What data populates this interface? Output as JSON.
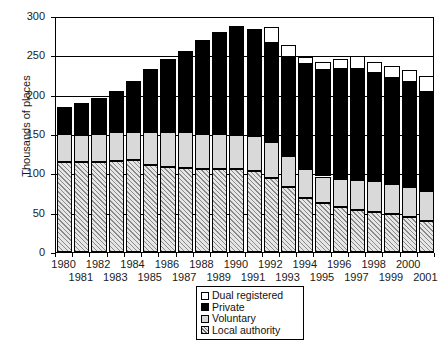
{
  "chart_data": {
    "type": "bar",
    "stacked": true,
    "title": "",
    "xlabel": "",
    "ylabel": "Thousands of places",
    "ylim": [
      0,
      300
    ],
    "yticks": [
      0,
      50,
      100,
      150,
      200,
      250,
      300
    ],
    "grid": true,
    "legend_position": "bottom-center",
    "categories": [
      "1980",
      "1981",
      "1982",
      "1983",
      "1984",
      "1985",
      "1986",
      "1987",
      "1988",
      "1989",
      "1990",
      "1991",
      "1992",
      "1993",
      "1994",
      "1995",
      "1996",
      "1997",
      "1998",
      "1999",
      "2000",
      "2001"
    ],
    "series": [
      {
        "name": "Local authority",
        "color": "#cfcfcf",
        "pattern": "diagonal-hatch",
        "values": [
          114,
          114,
          115,
          116,
          117,
          111,
          108,
          107,
          105,
          105,
          105,
          103,
          94,
          83,
          69,
          62,
          57,
          54,
          51,
          48,
          44,
          39
        ]
      },
      {
        "name": "Voluntary",
        "color": "#d9d9d9",
        "pattern": "solid",
        "values": [
          36,
          35,
          35,
          36,
          36,
          41,
          44,
          45,
          45,
          45,
          44,
          45,
          46,
          39,
          37,
          34,
          36,
          38,
          39,
          38,
          39,
          38
        ]
      },
      {
        "name": "Private",
        "color": "#000000",
        "pattern": "solid",
        "values": [
          34,
          41,
          46,
          53,
          64,
          81,
          93,
          103,
          119,
          130,
          138,
          135,
          126,
          126,
          133,
          136,
          140,
          141,
          138,
          135,
          133,
          126
        ]
      },
      {
        "name": "Dual registered",
        "color": "#ffffff",
        "pattern": "solid",
        "values": [
          0,
          0,
          0,
          0,
          0,
          0,
          0,
          0,
          0,
          0,
          0,
          0,
          20,
          15,
          9,
          9,
          12,
          16,
          14,
          15,
          16,
          21
        ]
      }
    ],
    "totals": [
      184,
      190,
      196,
      205,
      217,
      233,
      245,
      255,
      269,
      280,
      287,
      283,
      286,
      263,
      248,
      241,
      245,
      249,
      242,
      236,
      232,
      224
    ]
  },
  "legend": {
    "items": [
      {
        "label": "Dual registered",
        "swatch": "white-square-icon"
      },
      {
        "label": "Private",
        "swatch": "black-square-icon"
      },
      {
        "label": "Voluntary",
        "swatch": "gray-square-icon"
      },
      {
        "label": "Local authority",
        "swatch": "hatched-square-icon"
      }
    ]
  },
  "axes": {
    "y_title": "Thousands of places",
    "y_tick_labels": [
      "300",
      "250",
      "200",
      "150",
      "100",
      "50",
      "0"
    ],
    "x_tick_labels_top_row": [
      "1980",
      "1982",
      "1984",
      "1986",
      "1988",
      "1990",
      "1992",
      "1994",
      "1996",
      "1998",
      "2000"
    ],
    "x_tick_labels_bottom_row": [
      "1981",
      "1983",
      "1985",
      "1987",
      "1989",
      "1991",
      "1993",
      "1995",
      "1997",
      "1999",
      "2001"
    ]
  },
  "colors": {
    "axis": "#000000",
    "grid": "#000000",
    "private": "#000000",
    "voluntary": "#d9d9d9",
    "local_authority": "#cfcfcf",
    "dual_registered": "#ffffff"
  }
}
